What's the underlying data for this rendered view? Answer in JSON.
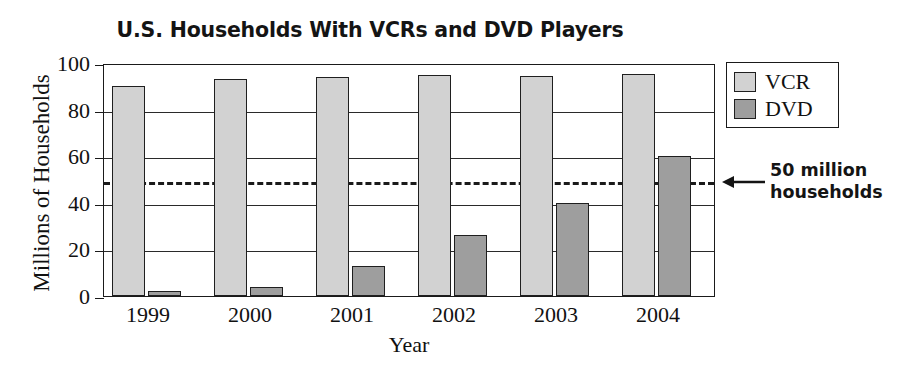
{
  "chart_data": {
    "type": "bar",
    "title": "U.S. Households With VCRs and DVD Players",
    "xlabel": "Year",
    "ylabel": "Millions of Households",
    "categories": [
      "1999",
      "2000",
      "2001",
      "2002",
      "2003",
      "2004"
    ],
    "series": [
      {
        "name": "VCR",
        "color": "#d2d2d2",
        "values": [
          90,
          93,
          94,
          95,
          94.5,
          95.5
        ]
      },
      {
        "name": "DVD",
        "color": "#9e9e9e",
        "values": [
          2,
          4,
          13,
          26,
          40,
          60
        ]
      }
    ],
    "ylim": [
      0,
      100
    ],
    "y_ticks": [
      "0",
      "20",
      "40",
      "60",
      "80",
      "100"
    ],
    "grid": "horizontal",
    "legend_position": "top-right",
    "annotations": [
      {
        "name": "threshold-line",
        "value": 50,
        "style": "dashed",
        "label_line1": "50 million",
        "label_line2": "households",
        "arrow": "left-arrow-icon"
      }
    ]
  },
  "legend": {
    "items": [
      {
        "label": "VCR",
        "swatch": "vcr-swatch"
      },
      {
        "label": "DVD",
        "swatch": "dvd-swatch"
      }
    ]
  }
}
